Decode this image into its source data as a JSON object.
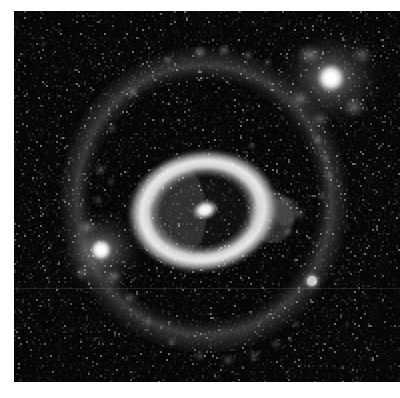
{
  "figure": {
    "domain_label": "astronomical-image",
    "caption": "",
    "plate": {
      "x": 14,
      "y": 11,
      "width": 386,
      "height": 371,
      "background_color": "#030303",
      "page_background_color": "#ffffff",
      "seam_y": 288
    }
  },
  "colorscale": {
    "name": "grayscale-linear",
    "black": "#000000",
    "dark": "#0a0a0a",
    "mid_dark": "#3a3a3a",
    "mid": "#8c8c8c",
    "bright": "#d2d2d2",
    "peak": "#ffffff"
  },
  "objects": {
    "inner_ring": {
      "name": "inner-bright-ring",
      "center_x": 203,
      "center_y": 211,
      "outer_rx": 74,
      "outer_ry": 59,
      "inner_rx": 45,
      "inner_ry": 36,
      "rotation_deg": -8,
      "peak_brightness": "#f2f2f2",
      "description": "bright elliptical star-forming ring"
    },
    "nucleus": {
      "name": "galaxy-nucleus",
      "center_x": 205,
      "center_y": 210,
      "rx": 13,
      "ry": 9,
      "rotation_deg": -18,
      "peak_brightness": "#ffffff",
      "description": "elongated bright nucleus inside the ring"
    },
    "outer_ring": {
      "name": "faint-outer-ring",
      "center_x": 204,
      "center_y": 200,
      "rx": 151,
      "ry": 160,
      "rotation_deg": -4,
      "peak_brightness": "#6e6e6e",
      "description": "faint clumpy outer ring arc"
    },
    "companion_ne": {
      "name": "bright-companion-upper-right",
      "center_x": 331,
      "center_y": 78,
      "core_radius": 15,
      "halo_radius": 56,
      "peak_brightness": "#ffffff",
      "description": "brightest companion galaxy, upper right"
    },
    "companion_sw": {
      "name": "bright-companion-left",
      "center_x": 101,
      "center_y": 250,
      "core_radius": 12,
      "halo_radius": 44,
      "peak_brightness": "#ffffff",
      "description": "second bright companion, left of ring"
    },
    "knot_se": {
      "name": "compact-knot-lower-right",
      "center_x": 312,
      "center_y": 281,
      "radius": 9,
      "peak_brightness": "#b4b4b4",
      "description": "small compact knot on the outer ring"
    }
  },
  "ring_knots": [
    {
      "x": 133,
      "y": 92,
      "r": 8,
      "b": 0.42
    },
    {
      "x": 168,
      "y": 60,
      "r": 7,
      "b": 0.36
    },
    {
      "x": 200,
      "y": 52,
      "r": 9,
      "b": 0.5
    },
    {
      "x": 224,
      "y": 50,
      "r": 8,
      "b": 0.46
    },
    {
      "x": 248,
      "y": 55,
      "r": 7,
      "b": 0.38
    },
    {
      "x": 268,
      "y": 62,
      "r": 6,
      "b": 0.3
    },
    {
      "x": 112,
      "y": 128,
      "r": 7,
      "b": 0.3
    },
    {
      "x": 100,
      "y": 170,
      "r": 8,
      "b": 0.34
    },
    {
      "x": 98,
      "y": 200,
      "r": 7,
      "b": 0.3
    },
    {
      "x": 111,
      "y": 182,
      "r": 6,
      "b": 0.26
    },
    {
      "x": 318,
      "y": 140,
      "r": 7,
      "b": 0.4
    },
    {
      "x": 326,
      "y": 158,
      "r": 6,
      "b": 0.36
    },
    {
      "x": 330,
      "y": 176,
      "r": 7,
      "b": 0.34
    },
    {
      "x": 322,
      "y": 196,
      "r": 6,
      "b": 0.3
    },
    {
      "x": 300,
      "y": 214,
      "r": 8,
      "b": 0.34
    },
    {
      "x": 288,
      "y": 232,
      "r": 7,
      "b": 0.28
    },
    {
      "x": 130,
      "y": 298,
      "r": 8,
      "b": 0.36
    },
    {
      "x": 148,
      "y": 322,
      "r": 7,
      "b": 0.34
    },
    {
      "x": 172,
      "y": 342,
      "r": 7,
      "b": 0.32
    },
    {
      "x": 200,
      "y": 356,
      "r": 7,
      "b": 0.34
    },
    {
      "x": 228,
      "y": 360,
      "r": 8,
      "b": 0.36
    },
    {
      "x": 254,
      "y": 356,
      "r": 7,
      "b": 0.34
    },
    {
      "x": 276,
      "y": 344,
      "r": 7,
      "b": 0.3
    },
    {
      "x": 296,
      "y": 324,
      "r": 6,
      "b": 0.26
    },
    {
      "x": 116,
      "y": 276,
      "r": 6,
      "b": 0.28
    },
    {
      "x": 252,
      "y": 146,
      "r": 6,
      "b": 0.26
    }
  ],
  "field_stars": [
    {
      "x": 44,
      "y": 44,
      "r": 2,
      "b": 0.18
    },
    {
      "x": 72,
      "y": 330,
      "r": 2,
      "b": 0.16
    },
    {
      "x": 352,
      "y": 300,
      "r": 2,
      "b": 0.14
    },
    {
      "x": 282,
      "y": 118,
      "r": 2,
      "b": 0.22
    },
    {
      "x": 348,
      "y": 228,
      "r": 2,
      "b": 0.16
    },
    {
      "x": 60,
      "y": 232,
      "r": 2,
      "b": 0.14
    },
    {
      "x": 244,
      "y": 112,
      "r": 2,
      "b": 0.18
    }
  ]
}
